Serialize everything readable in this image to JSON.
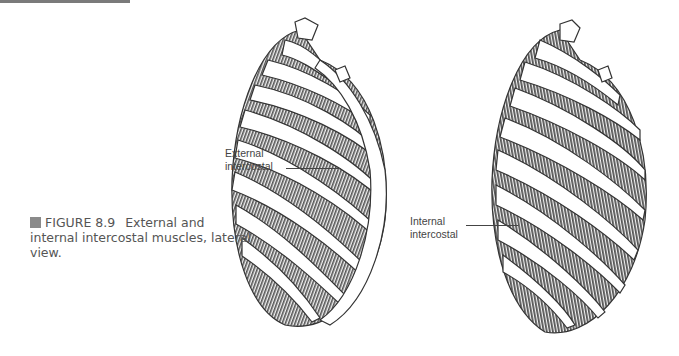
{
  "figure": {
    "number": "FIGURE 8.9",
    "caption": "External and internal intercostal muscles, lateral view.",
    "caption_line1": "External and",
    "caption_line2": "internal intercostal muscles, lateral",
    "caption_line3": "view."
  },
  "labels": {
    "external": {
      "line1": "External",
      "line2": "intercostal"
    },
    "internal": {
      "line1": "Internal",
      "line2": "intercostal"
    }
  },
  "colors": {
    "muscle": "#6e6e6e",
    "outline": "#333333",
    "caption_text": "#555555",
    "caption_square": "#8a8a8a"
  }
}
